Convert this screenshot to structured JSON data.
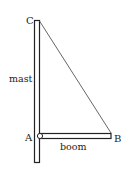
{
  "diagram": {
    "labels": {
      "point_c": "C",
      "point_a": "A",
      "point_b": "B",
      "mast": "mast",
      "boom": "boom"
    },
    "colors": {
      "stroke": "#222222",
      "fill": "#ffffff",
      "rope": "#555555"
    }
  }
}
